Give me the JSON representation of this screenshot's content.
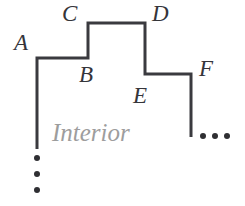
{
  "figure": {
    "width": 245,
    "height": 206,
    "background_color": "#ffffff",
    "stroke_color": "#3a3a3f",
    "stroke_width": 3,
    "label_color": "#35353a",
    "interior_label_color": "#9d9d9d",
    "dot_color": "#2f2f33"
  },
  "region": {
    "interior_label": "Interior",
    "interior_x": 52,
    "interior_y": 120
  },
  "boundary": {
    "description": "staircase polyline",
    "points": [
      {
        "x": 37,
        "y": 149
      },
      {
        "x": 37,
        "y": 58
      },
      {
        "x": 88,
        "y": 58
      },
      {
        "x": 88,
        "y": 23
      },
      {
        "x": 145,
        "y": 23
      },
      {
        "x": 145,
        "y": 74
      },
      {
        "x": 191,
        "y": 74
      },
      {
        "x": 191,
        "y": 137
      }
    ]
  },
  "vertices": [
    {
      "label": "A",
      "label_x": 14,
      "label_y": 31,
      "point_x": 37,
      "point_y": 58
    },
    {
      "label": "C",
      "label_x": 62,
      "label_y": 2,
      "point_x": 88,
      "point_y": 23
    },
    {
      "label": "D",
      "label_x": 152,
      "label_y": 2,
      "point_x": 145,
      "point_y": 23
    },
    {
      "label": "B",
      "label_x": 79,
      "label_y": 63,
      "point_x": 88,
      "point_y": 58
    },
    {
      "label": "E",
      "label_x": 133,
      "label_y": 84,
      "point_x": 145,
      "point_y": 74
    },
    {
      "label": "F",
      "label_x": 199,
      "label_y": 57,
      "point_x": 191,
      "point_y": 74
    }
  ],
  "ellipsis_vertical": {
    "label": "vertical continuation dots",
    "radius": 3,
    "dots": [
      {
        "x": 37,
        "y": 158
      },
      {
        "x": 37,
        "y": 174
      },
      {
        "x": 37,
        "y": 190
      }
    ]
  },
  "ellipsis_horizontal": {
    "label": "horizontal continuation dots",
    "radius": 3,
    "dots": [
      {
        "x": 203,
        "y": 136
      },
      {
        "x": 215,
        "y": 136
      },
      {
        "x": 227,
        "y": 136
      }
    ]
  }
}
